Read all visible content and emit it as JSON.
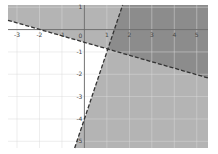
{
  "chart_data": {
    "type": "area",
    "title": "",
    "xlabel": "",
    "ylabel": "",
    "xlim": [
      -3.4,
      5.5
    ],
    "ylim": [
      -5.3,
      1.1
    ],
    "grid": true,
    "x_ticks": [
      "-3",
      "-2",
      "-1",
      "0",
      "1",
      "2",
      "3",
      "4",
      "5"
    ],
    "y_ticks": [
      "1",
      "0",
      "-1",
      "-2",
      "-3",
      "-4",
      "-5"
    ],
    "x_tick_values": [
      -3,
      -2,
      -1,
      0,
      1,
      2,
      3,
      4,
      5
    ],
    "y_tick_values": [
      1,
      0,
      -1,
      -2,
      -3,
      -4,
      -5
    ],
    "series": [
      {
        "name": "boundary-1",
        "style": "dashed",
        "slope": -0.29,
        "intercept": -0.57,
        "shade": "above"
      },
      {
        "name": "boundary-2",
        "style": "dashed",
        "slope": 3,
        "intercept": -4,
        "shade": "right"
      }
    ],
    "colors": {
      "shade_light": "#b4b4b4",
      "shade_dark": "#8c8c8c",
      "grid": "#dcdcdc",
      "axis": "#666666",
      "boundary": "#333333",
      "background": "#ffffff"
    }
  }
}
